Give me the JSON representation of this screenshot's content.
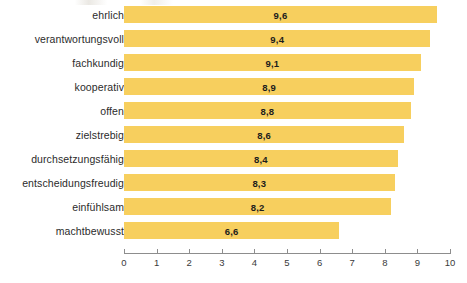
{
  "chart_data": {
    "type": "bar",
    "orientation": "horizontal",
    "title": "",
    "subtitle": "",
    "xlabel": "",
    "ylabel": "",
    "xlim": [
      0,
      10
    ],
    "grid": false,
    "legend": null,
    "decimal_separator": ",",
    "bar_color": "#f7cf5e",
    "label_color": "#2b2b2b",
    "value_color": "#1c1c1c",
    "axis_color": "#8d8d8d",
    "background": "#ffffff",
    "categories": [
      "ehrlich",
      "verantwortungsvoll",
      "fachkundig",
      "kooperativ",
      "offen",
      "zielstrebig",
      "durchsetzungsfähig",
      "entscheidungsfreudig",
      "einfühlsam",
      "machtbewusst"
    ],
    "values": [
      9.6,
      9.4,
      9.1,
      8.9,
      8.8,
      8.6,
      8.4,
      8.3,
      8.2,
      6.6
    ],
    "value_labels": [
      "9,6",
      "9,4",
      "9,1",
      "8,9",
      "8,8",
      "8,6",
      "8,4",
      "8,3",
      "8,2",
      "6,6"
    ],
    "x_ticks": [
      0,
      1,
      2,
      3,
      4,
      5,
      6,
      7,
      8,
      9,
      10
    ],
    "x_tick_labels": [
      "0",
      "1",
      "2",
      "3",
      "4",
      "5",
      "6",
      "7",
      "8",
      "9",
      "10"
    ]
  }
}
